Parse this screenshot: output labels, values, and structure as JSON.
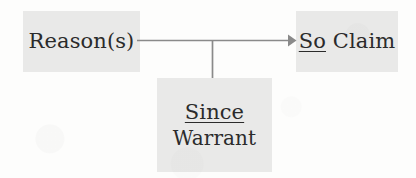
{
  "diagram": {
    "background_color": "#fdfdfc",
    "node_fill_color": "#e9e9e8",
    "text_color": "#2b2b2b",
    "line_color": "#8a8a8a",
    "nodes": {
      "reason": {
        "label": "Reason(s)",
        "name": "reason-node"
      },
      "claim": {
        "connective": "So",
        "label": "Claim",
        "name": "claim-node"
      },
      "warrant": {
        "connective": "Since",
        "label": "Warrant",
        "name": "warrant-node"
      }
    },
    "connectors": {
      "reason_to_claim": {
        "type": "arrow",
        "from": "reason",
        "to": "claim",
        "direction": "right"
      },
      "warrant_to_link": {
        "type": "line",
        "from": "warrant",
        "to": "reason_to_claim",
        "direction": "up"
      }
    }
  }
}
